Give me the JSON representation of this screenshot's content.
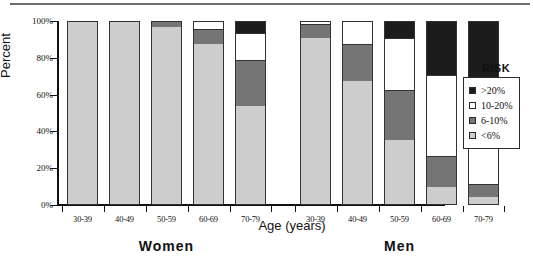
{
  "chart_data": {
    "type": "bar",
    "subtype": "stacked-percentage",
    "title": "",
    "xlabel": "Age (years)",
    "ylabel": "Percent",
    "ylim": [
      0,
      100
    ],
    "ytick_labels": [
      "0%",
      "20%",
      "40%",
      "60%",
      "80%",
      "100%"
    ],
    "ytick_values": [
      0,
      20,
      40,
      60,
      80,
      100
    ],
    "grid": false,
    "legend_title": "RISK",
    "legend_position": "right",
    "categories": [
      "30-39",
      "40-49",
      "50-59",
      "60-69",
      "70-79"
    ],
    "groups": [
      "Women",
      "Men"
    ],
    "series": [
      {
        "name": "<6%",
        "color": "#cdcdcd",
        "women": [
          100,
          100,
          96,
          87,
          53
        ],
        "men": [
          90,
          67,
          35,
          9,
          4
        ]
      },
      {
        "name": "6-10%",
        "color": "#757575",
        "women": [
          0,
          0,
          4,
          8,
          25
        ],
        "men": [
          8,
          20,
          27,
          17,
          7
        ]
      },
      {
        "name": "10-20%",
        "color": "#ffffff",
        "women": [
          0,
          0,
          0,
          5,
          15
        ],
        "men": [
          2,
          13,
          28,
          44,
          39
        ]
      },
      {
        "name": ">20%",
        "color": "#1c1c1c",
        "women": [
          0,
          0,
          0,
          0,
          7
        ],
        "men": [
          0,
          0,
          10,
          30,
          50
        ]
      }
    ]
  },
  "axes": {
    "y_title": "Percent",
    "x_title": "Age (years)",
    "y_ticks": [
      "100%",
      "80%",
      "60%",
      "40%",
      "20%",
      "0%"
    ]
  },
  "groups": [
    {
      "label": "Women",
      "categories": [
        "30-39",
        "40-49",
        "50-59",
        "60-69",
        "70-79"
      ]
    },
    {
      "label": "Men",
      "categories": [
        "30-39",
        "40-49",
        "50-59",
        "60-69",
        "70-79"
      ]
    }
  ],
  "legend": {
    "title": "RISK",
    "items": [
      {
        "label": ">20%",
        "color": "#1c1c1c"
      },
      {
        "label": "10-20%",
        "color": "#ffffff"
      },
      {
        "label": "6-10%",
        "color": "#757575"
      },
      {
        "label": "<6%",
        "color": "#cdcdcd"
      }
    ]
  },
  "colors": {
    "risk_over_20": "#1c1c1c",
    "risk_10_20": "#ffffff",
    "risk_6_10": "#757575",
    "risk_under_6": "#cdcdcd",
    "axis": "#111111",
    "outline": "#333333",
    "rule": "#6e6e6e"
  }
}
